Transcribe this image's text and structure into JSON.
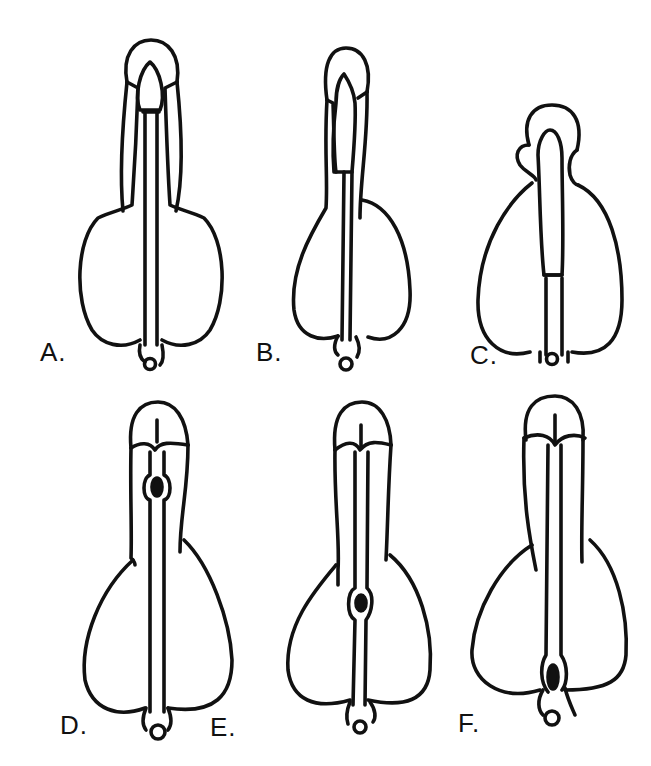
{
  "figure": {
    "panels": [
      {
        "id": "A",
        "label": "A."
      },
      {
        "id": "B",
        "label": "B."
      },
      {
        "id": "C",
        "label": "C."
      },
      {
        "id": "D",
        "label": "D."
      },
      {
        "id": "E",
        "label": "E."
      },
      {
        "id": "F",
        "label": "F."
      }
    ],
    "stroke_color": "#111111",
    "background": "#ffffff"
  }
}
